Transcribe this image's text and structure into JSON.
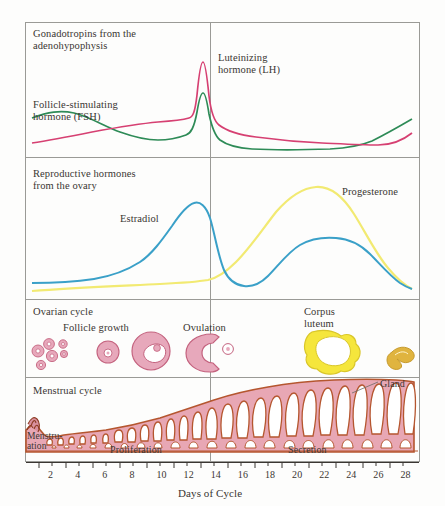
{
  "figure": {
    "title_implicit": "Female reproductive cycle",
    "axis": {
      "xlabel": "Days of Cycle",
      "tick_labels": [
        "2",
        "4",
        "6",
        "8",
        "10",
        "12",
        "14",
        "16",
        "18",
        "20",
        "22",
        "24",
        "26",
        "28"
      ],
      "tick_values": [
        2,
        4,
        6,
        8,
        10,
        12,
        14,
        16,
        18,
        20,
        22,
        24,
        26,
        28
      ],
      "xlim": [
        0,
        29
      ],
      "ovulation_marker_day": 14
    },
    "colors": {
      "lh_curve": "#d64072",
      "fsh_curve": "#2e8b57",
      "estradiol_curve": "#3aa0c8",
      "progesterone_curve": "#f2ea72",
      "follicle_fill": "#e7a8bb",
      "follicle_stroke": "#c4637f",
      "corpus_luteum": "#f5e63c",
      "corpus_albicans": "#d9a83a",
      "endometrium_fill": "#e8a7b4",
      "endometrium_stroke": "#b5562f",
      "panel_border": "#9a9a96",
      "background": "#fdfdfc",
      "text": "#3a3632"
    },
    "panels": [
      {
        "id": "gonadotropins",
        "heading": "Gonadotropins from the\nadenohypophysis",
        "labels": [
          {
            "name": "lh-label",
            "text": "Luteinizing\nhormone (LH)"
          },
          {
            "name": "fsh-label",
            "text": "Follicle-stimulating\nhormone (FSH)"
          }
        ]
      },
      {
        "id": "ovarian-hormones",
        "heading": "Reproductive hormones\nfrom the ovary",
        "labels": [
          {
            "name": "estradiol-label",
            "text": "Estradiol"
          },
          {
            "name": "progesterone-label",
            "text": "Progesterone"
          }
        ]
      },
      {
        "id": "ovarian-cycle",
        "heading": "Ovarian cycle",
        "labels": [
          {
            "name": "follicle-growth-label",
            "text": "Follicle growth"
          },
          {
            "name": "ovulation-label",
            "text": "Ovulation"
          },
          {
            "name": "corpus-luteum-label",
            "text": "Corpus\nluteum"
          }
        ]
      },
      {
        "id": "menstrual-cycle",
        "heading": "Menstrual cycle",
        "labels": [
          {
            "name": "gland-label",
            "text": "Gland"
          },
          {
            "name": "menstruation-label",
            "text": "Menstru-\nation"
          },
          {
            "name": "proliferation-label",
            "text": "Proliferation"
          },
          {
            "name": "secretion-label",
            "text": "Secretion"
          }
        ]
      }
    ]
  },
  "chart_data": {
    "type": "line",
    "xlabel": "Days of Cycle",
    "ylabel": "",
    "x": [
      1,
      2,
      3,
      4,
      5,
      6,
      7,
      8,
      9,
      10,
      11,
      12,
      13,
      14,
      15,
      16,
      17,
      18,
      19,
      20,
      21,
      22,
      23,
      24,
      25,
      26,
      27,
      28,
      29
    ],
    "xlim": [
      0,
      29
    ],
    "grid": false,
    "legend": "inline-annotations",
    "series": [
      {
        "name": "Luteinizing hormone (LH)",
        "panel": "gonadotropins",
        "color": "#d64072",
        "values": [
          10,
          11,
          12,
          14,
          16,
          18,
          20,
          22,
          24,
          26,
          28,
          31,
          55,
          100,
          40,
          30,
          27,
          25,
          23,
          22,
          21,
          20,
          20,
          20,
          20,
          21,
          24,
          30,
          36
        ]
      },
      {
        "name": "Follicle-stimulating hormone (FSH)",
        "panel": "gonadotropins",
        "color": "#2e8b57",
        "values": [
          32,
          33,
          33,
          32,
          30,
          27,
          24,
          22,
          20,
          19,
          18,
          18,
          22,
          62,
          28,
          20,
          17,
          15,
          14,
          13,
          12,
          12,
          12,
          12,
          13,
          16,
          24,
          38,
          50
        ]
      },
      {
        "name": "Estradiol",
        "panel": "ovarian-hormones",
        "color": "#3aa0c8",
        "values": [
          8,
          8,
          8,
          9,
          10,
          11,
          13,
          16,
          20,
          26,
          34,
          48,
          68,
          82,
          70,
          36,
          18,
          14,
          16,
          22,
          32,
          42,
          48,
          50,
          50,
          46,
          36,
          22,
          12
        ]
      },
      {
        "name": "Progesterone",
        "panel": "ovarian-hormones",
        "color": "#f2ea72",
        "values": [
          2,
          2,
          2,
          2,
          2,
          2,
          2,
          2,
          3,
          3,
          4,
          4,
          5,
          6,
          10,
          20,
          36,
          54,
          70,
          84,
          93,
          96,
          92,
          80,
          62,
          42,
          24,
          12,
          6
        ]
      }
    ],
    "phase_bands": [
      {
        "name": "Menstruation",
        "days": [
          1,
          4
        ]
      },
      {
        "name": "Proliferation",
        "days": [
          5,
          14
        ]
      },
      {
        "name": "Secretion",
        "days": [
          15,
          28
        ]
      }
    ],
    "ovarian_stages": [
      {
        "name": "primordial-follicles",
        "day_approx": 2
      },
      {
        "name": "primary-follicle",
        "day_approx": 7
      },
      {
        "name": "graafian-follicle",
        "day_approx": 11
      },
      {
        "name": "ovulation",
        "day_approx": 14
      },
      {
        "name": "corpus-luteum",
        "day_approx": 21
      },
      {
        "name": "corpus-albicans",
        "day_approx": 27
      }
    ]
  }
}
